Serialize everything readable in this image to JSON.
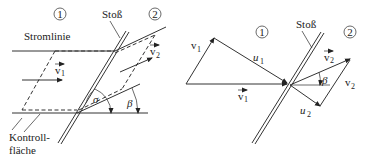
{
  "left_diagram": {
    "region_1_label": "1",
    "region_2_label": "2",
    "shock_label": "Stoß",
    "streamline_label": "Stromlinie",
    "control_surface_label_line1": "Kontroll-",
    "control_surface_label_line2": "fläche",
    "velocity_1_label": "v",
    "velocity_1_sub": "1",
    "velocity_2_label": "v",
    "velocity_2_sub": "2",
    "angle_sigma": "σ",
    "angle_beta": "β"
  },
  "right_diagram": {
    "region_1_label": "1",
    "region_2_label": "2",
    "shock_label": "Stoß",
    "v1_normal_label": "v",
    "v1_normal_sub": "1",
    "u1_label": "u",
    "u1_sub": "1",
    "vec_v1_label": "v",
    "vec_v1_sub": "1",
    "vec_v2_label": "v",
    "vec_v2_sub": "2",
    "v2_normal_label": "v",
    "v2_normal_sub": "2",
    "u2_label": "u",
    "u2_sub": "2",
    "angle_beta": "β"
  },
  "colors": {
    "stroke": "#333333",
    "background": "#ffffff"
  }
}
